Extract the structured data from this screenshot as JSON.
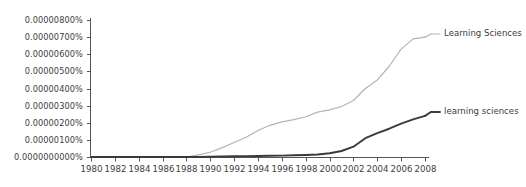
{
  "chart_data": {
    "type": "line",
    "title": "",
    "subtitle": "",
    "xlabel": "",
    "ylabel": "",
    "grid": false,
    "legend_position": "right-inline",
    "xlim": [
      1980,
      2008
    ],
    "ylim": [
      0,
      8e-06
    ],
    "x_tick_labels": [
      "1980",
      "1982",
      "1984",
      "1986",
      "1988",
      "1990",
      "1992",
      "1994",
      "1996",
      "1998",
      "2000",
      "2002",
      "2004",
      "2006",
      "2008"
    ],
    "x_tick_values": [
      1980,
      1982,
      1984,
      1986,
      1988,
      1990,
      1992,
      1994,
      1996,
      1998,
      2000,
      2002,
      2004,
      2006,
      2008
    ],
    "y_tick_labels": [
      "0.00000800%",
      "0.00000700%",
      "0.00000600%",
      "0.00000500%",
      "0.00000400%",
      "0.00000300%",
      "0.00000200%",
      "0.00000100%",
      "0.0000000000%"
    ],
    "y_tick_values": [
      8e-06,
      7e-06,
      6e-06,
      5e-06,
      4e-06,
      3e-06,
      2e-06,
      1e-06,
      0
    ],
    "x": [
      1980,
      1981,
      1982,
      1983,
      1984,
      1985,
      1986,
      1987,
      1988,
      1989,
      1990,
      1991,
      1992,
      1993,
      1994,
      1995,
      1996,
      1997,
      1998,
      1999,
      2000,
      2001,
      2002,
      2003,
      2004,
      2005,
      2006,
      2007,
      2008
    ],
    "series": [
      {
        "name": "Learning Sciences",
        "color": "#b4b4b4",
        "values": [
          0.0,
          0.0,
          0.0,
          0.0,
          0.0,
          0.0,
          0.0,
          0.0,
          0.0,
          1.2e-07,
          2.8e-07,
          5.5e-07,
          8.5e-07,
          1.15e-06,
          1.55e-06,
          1.85e-06,
          2.05e-06,
          2.18e-06,
          2.35e-06,
          2.62e-06,
          2.75e-06,
          2.95e-06,
          3.3e-06,
          4e-06,
          4.5e-06,
          5.3e-06,
          6.3e-06,
          6.9e-06,
          7e-06
        ]
      },
      {
        "name": "learning sciences",
        "color": "#3a3a3a",
        "values": [
          0.0,
          0.0,
          0.0,
          0.0,
          0.0,
          0.0,
          0.0,
          0.0,
          0.0,
          0.0,
          2e-08,
          3e-08,
          4e-08,
          5e-08,
          6e-08,
          7e-08,
          8e-08,
          1e-07,
          1.2e-07,
          1.5e-07,
          2.2e-07,
          3.5e-07,
          6e-07,
          1.1e-06,
          1.4e-06,
          1.65e-06,
          1.95e-06,
          2.2e-06,
          2.4e-06
        ]
      }
    ],
    "annotations": [
      {
        "name": "Learning Sciences",
        "x": 2008,
        "y": 7e-06
      },
      {
        "name": "learning sciences",
        "x": 2008,
        "y": 2.4e-06
      }
    ]
  },
  "axis": {
    "spine_color": "#555555",
    "tick_color": "#555555"
  }
}
